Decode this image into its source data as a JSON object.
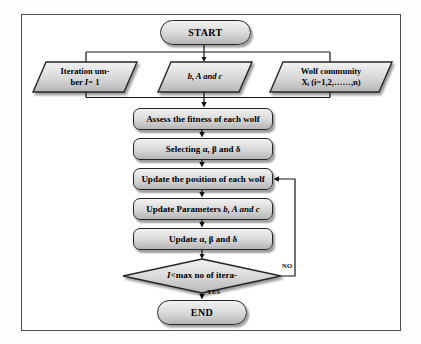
{
  "flowchart": {
    "start": {
      "label": "START"
    },
    "inputs": {
      "iteration": {
        "line1": "Iteration um-",
        "line2_pre": "ber ",
        "line2_italic": "I",
        "line2_post": "= 1"
      },
      "coefficients": {
        "italic": "b, A and c"
      },
      "wolf_community": {
        "line1": "Wolf community",
        "line2": "Xᵢ (i=1,2,……,n)"
      }
    },
    "steps": [
      {
        "label": "Assess the fitness of each wolf"
      },
      {
        "label": "Selecting α, β and δ"
      },
      {
        "label": "Update the position of each wolf"
      },
      {
        "label": "Update Parameters ",
        "italic": "b, A and c"
      },
      {
        "label": "Update α, β and δ"
      }
    ],
    "decision": {
      "italic": "I<",
      "label": " max no of itera-"
    },
    "end": {
      "label": "END"
    },
    "branch_labels": {
      "no": "NO",
      "yes": "YES"
    }
  },
  "colors": {
    "shape_fill_top": "#f2f2f2",
    "shape_fill_mid": "#d9d9d9",
    "shape_fill_bottom": "#b6b6b6",
    "shape_border": "#262626",
    "connector_line": "#151515",
    "frame_border": "#4f4f4f",
    "background": "#ffffff"
  }
}
